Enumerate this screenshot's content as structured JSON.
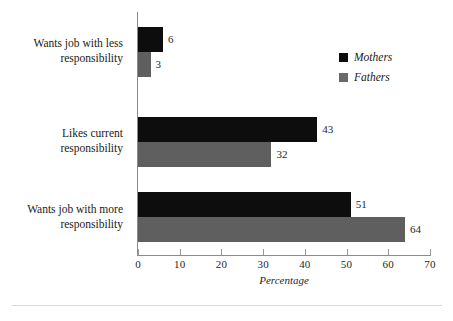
{
  "chart_data": {
    "type": "bar",
    "orientation": "horizontal",
    "title": "",
    "xlabel": "Percentage",
    "ylabel": "",
    "xlim": [
      0,
      70
    ],
    "xticks": [
      0,
      10,
      20,
      30,
      40,
      50,
      60,
      70
    ],
    "grid": false,
    "legend_position": "top-right",
    "categories": [
      "Wants job with less responsibility",
      "Likes current responsibility",
      "Wants job with more responsibility"
    ],
    "category_lines": [
      [
        "Wants job with less",
        "responsibility"
      ],
      [
        "Likes current",
        "responsibility"
      ],
      [
        "Wants job with more",
        "responsibility"
      ]
    ],
    "series": [
      {
        "name": "Mothers",
        "color": "#0d0d0d",
        "values": [
          6,
          43,
          51
        ]
      },
      {
        "name": "Fathers",
        "color": "#5f5f5f",
        "values": [
          3,
          32,
          64
        ]
      }
    ],
    "data_labels": [
      "6",
      "3",
      "43",
      "32",
      "51",
      "64"
    ]
  },
  "legend": {
    "items": [
      {
        "label": "Mothers",
        "color": "#0d0d0d"
      },
      {
        "label": "Fathers",
        "color": "#6a6a6a"
      }
    ]
  },
  "axis": {
    "x_title": "Percentage",
    "tick_labels": [
      "0",
      "10",
      "20",
      "30",
      "40",
      "50",
      "60",
      "70"
    ]
  },
  "colors": {
    "mothers": "#0d0d0d",
    "fathers": "#5f5f5f",
    "axis": "#8c8c8c",
    "text": "#1a1a1a",
    "rule": "#d9d9d9",
    "background": "#ffffff"
  }
}
